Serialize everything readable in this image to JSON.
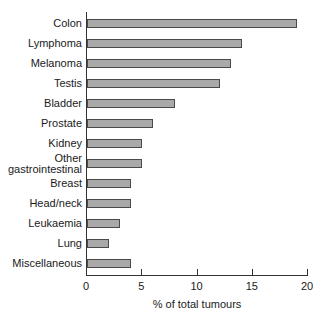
{
  "chart_data": {
    "type": "bar",
    "orientation": "horizontal",
    "title": "",
    "xlabel": "% of total tumours",
    "ylabel": "",
    "xlim": [
      0,
      20
    ],
    "xticks": [
      0,
      5,
      10,
      15,
      20
    ],
    "grid": false,
    "legend": null,
    "categories": [
      "Colon",
      "Lymphoma",
      "Melanoma",
      "Testis",
      "Bladder",
      "Prostate",
      "Kidney",
      "Other gastrointestinal",
      "Breast",
      "Head/neck",
      "Leukaemia",
      "Lung",
      "Miscellaneous"
    ],
    "values": [
      19,
      14,
      13,
      12,
      8,
      6,
      5,
      5,
      4,
      4,
      3,
      2,
      4
    ]
  },
  "labels": [
    {
      "lines": [
        "Colon"
      ]
    },
    {
      "lines": [
        "Lymphoma"
      ]
    },
    {
      "lines": [
        "Melanoma"
      ]
    },
    {
      "lines": [
        "Testis"
      ]
    },
    {
      "lines": [
        "Bladder"
      ]
    },
    {
      "lines": [
        "Prostate"
      ]
    },
    {
      "lines": [
        "Kidney"
      ]
    },
    {
      "lines": [
        "Other",
        "gastrointestinal"
      ]
    },
    {
      "lines": [
        "Breast"
      ]
    },
    {
      "lines": [
        "Head/neck"
      ]
    },
    {
      "lines": [
        "Leukaemia"
      ]
    },
    {
      "lines": [
        "Lung"
      ]
    },
    {
      "lines": [
        "Miscellaneous"
      ]
    }
  ],
  "colors": {
    "bar_fill": "#a9a9a9",
    "bar_border": "#4a4a4a",
    "axis": "#333333"
  }
}
